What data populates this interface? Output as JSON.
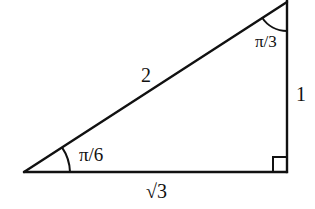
{
  "diagram": {
    "type": "right-triangle",
    "colors": {
      "stroke": "#111111",
      "background": "#ffffff"
    },
    "vertices": {
      "bottom_left": [
        24,
        172
      ],
      "top_right": [
        287,
        2
      ],
      "bottom_right": [
        287,
        172
      ]
    },
    "sides": {
      "hypotenuse": {
        "label": "2"
      },
      "vertical_leg": {
        "label": "1"
      },
      "horizontal_leg": {
        "label": "√3"
      }
    },
    "angles": {
      "bottom_left": {
        "label": "π/6"
      },
      "top_right": {
        "label": "π/3"
      },
      "bottom_right": {
        "label": "right-angle",
        "marker": "square"
      }
    }
  }
}
